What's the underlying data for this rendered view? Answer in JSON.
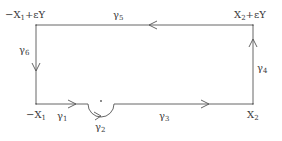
{
  "diagram": {
    "corners": {
      "top_left": {
        "base": "−X",
        "sub": "1",
        "suffix": "+εY"
      },
      "top_right": {
        "base": "X",
        "sub": "2",
        "suffix": "+εY"
      },
      "bottom_left": {
        "base": "−X",
        "sub": "1"
      },
      "bottom_right": {
        "base": "X",
        "sub": "2"
      }
    },
    "paths": [
      {
        "id": "gamma1",
        "base": "γ",
        "sub": "1",
        "direction": "right"
      },
      {
        "id": "gamma2",
        "base": "γ",
        "sub": "2",
        "direction": "semicircle-below"
      },
      {
        "id": "gamma3",
        "base": "γ",
        "sub": "3",
        "direction": "right"
      },
      {
        "id": "gamma4",
        "base": "γ",
        "sub": "4",
        "direction": "up"
      },
      {
        "id": "gamma5",
        "base": "γ",
        "sub": "5",
        "direction": "left"
      },
      {
        "id": "gamma6",
        "base": "γ",
        "sub": "6",
        "direction": "down"
      }
    ],
    "line_color": "#555555"
  }
}
